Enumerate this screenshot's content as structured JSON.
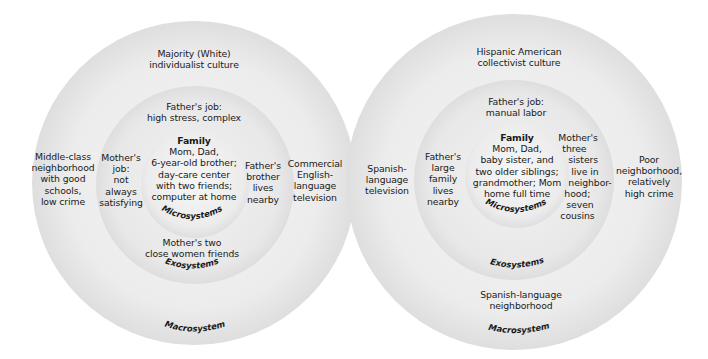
{
  "diagrams": [
    {
      "id": "majority",
      "macro": {
        "top": [
          "Majority (White)",
          "individualist culture"
        ],
        "left": [
          "Middle-class",
          "neighborhood",
          "with good",
          "schools,",
          "low crime"
        ],
        "right": [
          "Commercial",
          "English-",
          "language",
          "television"
        ],
        "bottom": [],
        "label": "Macrosystem"
      },
      "exo": {
        "top": [
          "Father's job:",
          "high stress, complex"
        ],
        "left": [
          "Mother's",
          "job:",
          "not",
          "always",
          "satisfying"
        ],
        "right": [
          "Father's",
          "brother",
          "lives",
          "nearby"
        ],
        "bottom": [
          "Mother's two",
          "close women friends"
        ],
        "label": "Exosystems"
      },
      "micro": {
        "title": "Family",
        "lines": [
          "Mom, Dad,",
          "6-year-old brother;",
          "day-care center",
          "with two friends;",
          "computer at home"
        ],
        "label": "Microsystems"
      }
    },
    {
      "id": "hispanic",
      "macro": {
        "top": [
          "Hispanic American",
          "collectivist culture"
        ],
        "left": [
          "Spanish-",
          "language",
          "television"
        ],
        "right": [
          "Poor",
          "neighborhood,",
          "relatively",
          "high crime"
        ],
        "bottom": [
          "Spanish-language",
          "neighborhood"
        ],
        "label": "Macrosystem"
      },
      "exo": {
        "top": [
          "Father's job:",
          "manual labor"
        ],
        "left": [
          "Father's",
          "large",
          "family",
          "lives",
          "nearby"
        ],
        "right": [
          "Mother's",
          "three",
          "sisters",
          "live in",
          "neighbor-",
          "hood;",
          "seven",
          "cousins"
        ],
        "bottom": [],
        "label": "Exosystems"
      },
      "micro": {
        "title": "Family",
        "lines": [
          "Mom, Dad,",
          "baby sister, and",
          "two older siblings;",
          "grandmother; Mom",
          "home full time"
        ],
        "label": "Microsystems"
      }
    }
  ],
  "colors": {
    "background": "#ffffff",
    "ring_light": "#f2f2f2",
    "ring_edge": "#bdbdbd",
    "text": "#1a1a1a"
  }
}
